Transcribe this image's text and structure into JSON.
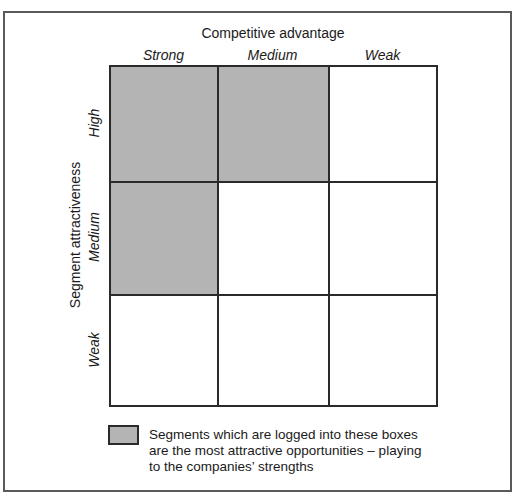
{
  "figure": {
    "caption_cropped": "Figure: Targeting attractive market segments"
  },
  "matrix": {
    "x_axis_title": "Competitive advantage",
    "y_axis_title": "Segment attractiveness",
    "columns": [
      "Strong",
      "Medium",
      "Weak"
    ],
    "rows": [
      "High",
      "Medium",
      "Weak"
    ],
    "shaded_cells": [
      [
        0,
        0
      ],
      [
        0,
        1
      ],
      [
        1,
        0
      ]
    ],
    "shade_color": "#b4b4b4",
    "line_color": "#2a2a2a"
  },
  "legend": {
    "lines": [
      "Segments which are logged into these boxes",
      "are the most attractive opportunities – playing",
      "to the companies’ strengths"
    ]
  }
}
